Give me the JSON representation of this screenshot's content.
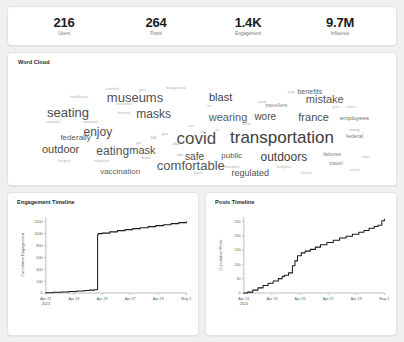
{
  "kpis": [
    {
      "value": "216",
      "label": "Users"
    },
    {
      "value": "264",
      "label": "Posts"
    },
    {
      "value": "1.4K",
      "label": "Engagement"
    },
    {
      "value": "9.7M",
      "label": "Influence"
    }
  ],
  "word_cloud": {
    "title": "Word Cloud",
    "words": [
      {
        "text": "transportation",
        "size": 17,
        "color": "#3d3d3d",
        "x": 71.5,
        "y": 62
      },
      {
        "text": "covid",
        "size": 17,
        "color": "#4a4a4a",
        "x": 48.5,
        "y": 63
      },
      {
        "text": "comfortable",
        "size": 13,
        "color": "#555555",
        "x": 47,
        "y": 86
      },
      {
        "text": "museums",
        "size": 13,
        "color": "#4f4f4f",
        "x": 32,
        "y": 27
      },
      {
        "text": "seating",
        "size": 13,
        "color": "#4c4c4c",
        "x": 14,
        "y": 40
      },
      {
        "text": "outdoors",
        "size": 12,
        "color": "#3f3f3f",
        "x": 72,
        "y": 79
      },
      {
        "text": "mistake",
        "size": 11,
        "color": "#565656",
        "x": 83,
        "y": 29
      },
      {
        "text": "eating",
        "size": 12,
        "color": "#535353",
        "x": 26,
        "y": 74
      },
      {
        "text": "masks",
        "size": 12,
        "color": "#4d4d4d",
        "x": 37,
        "y": 42
      },
      {
        "text": "wearing",
        "size": 11,
        "color": "#5a5a5a",
        "x": 57,
        "y": 44
      },
      {
        "text": "enjoy",
        "size": 12,
        "color": "#515151",
        "x": 22,
        "y": 57
      },
      {
        "text": "mask",
        "size": 11,
        "color": "#4e4e4e",
        "x": 34,
        "y": 73
      },
      {
        "text": "france",
        "size": 11,
        "color": "#4c4c4c",
        "x": 80,
        "y": 44
      },
      {
        "text": "outdoor",
        "size": 11,
        "color": "#464646",
        "x": 12,
        "y": 72
      },
      {
        "text": "blast",
        "size": 11,
        "color": "#3f3f3f",
        "x": 55,
        "y": 27
      },
      {
        "text": "wore",
        "size": 10,
        "color": "#4b4b4b",
        "x": 67,
        "y": 44
      },
      {
        "text": "safe",
        "size": 10,
        "color": "#4a4a4a",
        "x": 48,
        "y": 79
      },
      {
        "text": "regulated",
        "size": 9,
        "color": "#4f4f4f",
        "x": 63,
        "y": 93
      },
      {
        "text": "federally",
        "size": 8,
        "color": "#595959",
        "x": 16,
        "y": 63
      },
      {
        "text": "vaccination",
        "size": 8,
        "color": "#5d5d5d",
        "x": 28,
        "y": 92
      },
      {
        "text": "public",
        "size": 8,
        "color": "#575757",
        "x": 58,
        "y": 78
      },
      {
        "text": "benefits",
        "size": 7,
        "color": "#626262",
        "x": 79,
        "y": 22
      },
      {
        "text": "employees",
        "size": 6,
        "color": "#6d6d6d",
        "x": 91,
        "y": 45
      },
      {
        "text": "travellers",
        "size": 5.5,
        "color": "#8a8a8a",
        "x": 70,
        "y": 35
      },
      {
        "text": "federal",
        "size": 5.5,
        "color": "#7b7b7b",
        "x": 91,
        "y": 62
      },
      {
        "text": "failures",
        "size": 5.5,
        "color": "#7f7f7f",
        "x": 85,
        "y": 77
      },
      {
        "text": "travel",
        "size": 5.5,
        "color": "#838383",
        "x": 86,
        "y": 85
      },
      {
        "text": "trump",
        "size": 4,
        "color": "#a3a3a3",
        "x": 91,
        "y": 56
      },
      {
        "text": "disapproval",
        "size": 4,
        "color": "#b2b2b2",
        "x": 43,
        "y": 19
      },
      {
        "text": "candles",
        "size": 4,
        "color": "#b6b6b6",
        "x": 26,
        "y": 20
      },
      {
        "text": "gets",
        "size": 4,
        "color": "#b0b0b0",
        "x": 34,
        "y": 21
      },
      {
        "text": "healthcare",
        "size": 4,
        "color": "#b4b4b4",
        "x": 17,
        "y": 27
      },
      {
        "text": "essential",
        "size": 4,
        "color": "#b5b5b5",
        "x": 29,
        "y": 33
      },
      {
        "text": "schools",
        "size": 4,
        "color": "#b0b0b0",
        "x": 10,
        "y": 49
      },
      {
        "text": "national",
        "size": 4,
        "color": "#adadad",
        "x": 20,
        "y": 49
      },
      {
        "text": "formula",
        "size": 4,
        "color": "#b3b3b3",
        "x": 29,
        "y": 41
      },
      {
        "text": "longest",
        "size": 4,
        "color": "#b8b8b8",
        "x": 13,
        "y": 83
      },
      {
        "text": "negative",
        "size": 4,
        "color": "#b6b6b6",
        "x": 23,
        "y": 83
      },
      {
        "text": "bank",
        "size": 4,
        "color": "#b1b1b1",
        "x": 35,
        "y": 80
      },
      {
        "text": "ads",
        "size": 4,
        "color": "#aaaaaa",
        "x": 44,
        "y": 77
      },
      {
        "text": "out",
        "size": 4.5,
        "color": "#a5a5a5",
        "x": 43,
        "y": 68
      },
      {
        "text": "cut",
        "size": 4.5,
        "color": "#a8a8a8",
        "x": 37,
        "y": 63
      },
      {
        "text": "put",
        "size": 4,
        "color": "#adadad",
        "x": 33,
        "y": 67
      },
      {
        "text": "gov",
        "size": 4,
        "color": "#b0b0b0",
        "x": 40,
        "y": 59
      },
      {
        "text": "vax",
        "size": 4,
        "color": "#b2b2b2",
        "x": 47,
        "y": 52
      },
      {
        "text": "sit",
        "size": 4,
        "color": "#b4b4b4",
        "x": 50,
        "y": 57
      },
      {
        "text": "nt",
        "size": 4,
        "color": "#b3b3b3",
        "x": 54,
        "y": 56
      },
      {
        "text": "air",
        "size": 4,
        "color": "#a8a8a8",
        "x": 52,
        "y": 35
      },
      {
        "text": "sued",
        "size": 4,
        "color": "#b0b0b0",
        "x": 66,
        "y": 31
      },
      {
        "text": "jury",
        "size": 4,
        "color": "#b2b2b2",
        "x": 74,
        "y": 23
      },
      {
        "text": "gun",
        "size": 4,
        "color": "#b4b4b4",
        "x": 86,
        "y": 36
      },
      {
        "text": "rules",
        "size": 4,
        "color": "#b3b3b3",
        "x": 90,
        "y": 36
      },
      {
        "text": "pass",
        "size": 4,
        "color": "#b1b1b1",
        "x": 62,
        "y": 50
      },
      {
        "text": "mandate",
        "size": 4,
        "color": "#b5b5b5",
        "x": 58,
        "y": 88
      },
      {
        "text": "stock",
        "size": 4,
        "color": "#b6b6b6",
        "x": 91,
        "y": 90
      },
      {
        "text": "horror",
        "size": 4,
        "color": "#b4b4b4",
        "x": 78,
        "y": 93
      },
      {
        "text": "budgets",
        "size": 4,
        "color": "#b7b7b7",
        "x": 72,
        "y": 88
      },
      {
        "text": "now",
        "size": 4,
        "color": "#b2b2b2",
        "x": 94,
        "y": 79
      },
      {
        "text": "back",
        "size": 4,
        "color": "#b5b5b5",
        "x": 49,
        "y": 93
      }
    ]
  },
  "chart_data": [
    {
      "type": "line",
      "title": "Engagement Timeline",
      "xlabel": "",
      "ylabel": "Cumulative Engagement",
      "ylim": [
        0,
        1280
      ],
      "yticks": [
        0,
        200,
        400,
        600,
        800,
        1000,
        1200
      ],
      "ytick_labels": [
        "0",
        "200",
        "400",
        "600",
        "800",
        "1000",
        "1200"
      ],
      "xticks": [
        "Apr 21\n2023",
        "Apr 23",
        "Apr 25",
        "Apr 27",
        "Apr 29",
        "May 1"
      ],
      "grid": false,
      "legend": "none",
      "x": [
        0,
        0.6,
        1.2,
        1.8,
        2.4,
        3.0,
        3.4,
        3.8,
        4.0,
        4.05,
        4.1,
        4.4,
        5.0,
        5.6,
        6.2,
        6.8,
        7.4,
        8.0,
        8.6,
        9.2,
        9.8,
        10.4,
        11.0
      ],
      "values": [
        5,
        12,
        18,
        26,
        34,
        42,
        48,
        55,
        60,
        980,
        1000,
        1008,
        1030,
        1050,
        1068,
        1085,
        1100,
        1118,
        1135,
        1150,
        1168,
        1185,
        1200
      ]
    },
    {
      "type": "line",
      "title": "Posts Timeline",
      "xlabel": "",
      "ylabel": "Cumulative Posts",
      "ylim": [
        0,
        265
      ],
      "yticks": [
        0,
        50,
        100,
        150,
        200,
        250
      ],
      "ytick_labels": [
        "0",
        "50",
        "100",
        "150",
        "200",
        "250"
      ],
      "xticks": [
        "Apr 21\n2023",
        "Apr 23",
        "Apr 25",
        "Apr 27",
        "Apr 29",
        "May 1"
      ],
      "grid": false,
      "legend": "none",
      "x": [
        0,
        0.3,
        0.7,
        1.1,
        1.5,
        1.9,
        2.3,
        2.7,
        3.0,
        3.2,
        3.5,
        3.8,
        4.0,
        4.2,
        4.5,
        4.8,
        5.2,
        5.6,
        6.0,
        6.5,
        7.0,
        7.5,
        8.0,
        8.5,
        9.0,
        9.4,
        9.8,
        10.2,
        10.5,
        10.8,
        11.0
      ],
      "values": [
        0,
        3,
        10,
        18,
        26,
        34,
        42,
        50,
        58,
        62,
        70,
        95,
        112,
        130,
        140,
        146,
        152,
        160,
        168,
        176,
        184,
        192,
        198,
        205,
        212,
        218,
        226,
        232,
        236,
        252,
        258
      ]
    }
  ]
}
